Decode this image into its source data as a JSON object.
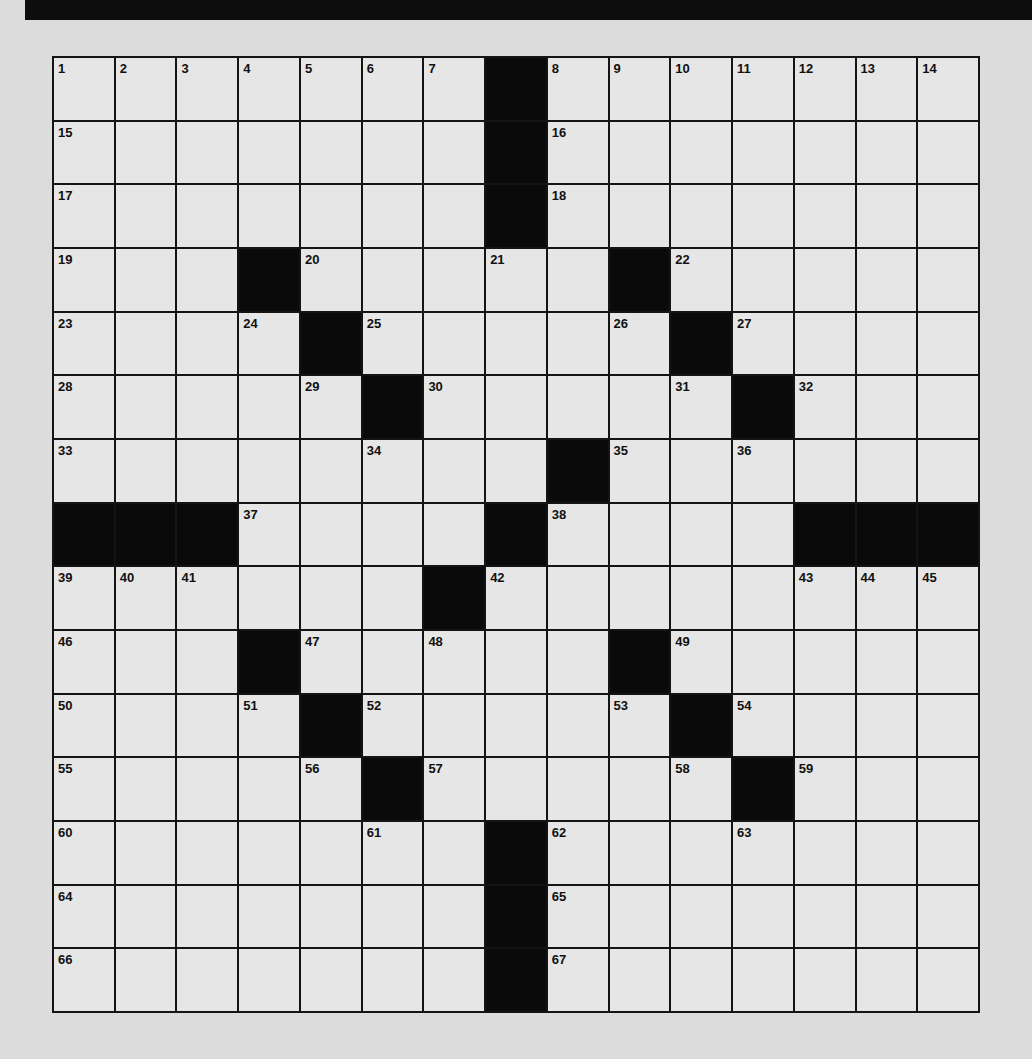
{
  "puzzle": {
    "rows": 15,
    "cols": 15,
    "colors": {
      "background": "#dcdcdc",
      "cell": "#e6e6e6",
      "block": "#0a0a0a",
      "line": "#141414"
    },
    "blacks": [
      [
        0,
        7
      ],
      [
        1,
        7
      ],
      [
        2,
        7
      ],
      [
        3,
        3
      ],
      [
        3,
        9
      ],
      [
        4,
        4
      ],
      [
        4,
        10
      ],
      [
        5,
        5
      ],
      [
        5,
        11
      ],
      [
        6,
        8
      ],
      [
        7,
        0
      ],
      [
        7,
        1
      ],
      [
        7,
        2
      ],
      [
        7,
        7
      ],
      [
        7,
        12
      ],
      [
        7,
        13
      ],
      [
        7,
        14
      ],
      [
        8,
        6
      ],
      [
        9,
        3
      ],
      [
        9,
        9
      ],
      [
        10,
        4
      ],
      [
        10,
        10
      ],
      [
        11,
        5
      ],
      [
        11,
        11
      ],
      [
        12,
        7
      ],
      [
        13,
        7
      ],
      [
        14,
        7
      ]
    ],
    "numbers": [
      {
        "r": 0,
        "c": 0,
        "n": "1"
      },
      {
        "r": 0,
        "c": 1,
        "n": "2"
      },
      {
        "r": 0,
        "c": 2,
        "n": "3"
      },
      {
        "r": 0,
        "c": 3,
        "n": "4"
      },
      {
        "r": 0,
        "c": 4,
        "n": "5"
      },
      {
        "r": 0,
        "c": 5,
        "n": "6"
      },
      {
        "r": 0,
        "c": 6,
        "n": "7"
      },
      {
        "r": 0,
        "c": 8,
        "n": "8"
      },
      {
        "r": 0,
        "c": 9,
        "n": "9"
      },
      {
        "r": 0,
        "c": 10,
        "n": "10"
      },
      {
        "r": 0,
        "c": 11,
        "n": "11"
      },
      {
        "r": 0,
        "c": 12,
        "n": "12"
      },
      {
        "r": 0,
        "c": 13,
        "n": "13"
      },
      {
        "r": 0,
        "c": 14,
        "n": "14"
      },
      {
        "r": 1,
        "c": 0,
        "n": "15"
      },
      {
        "r": 1,
        "c": 8,
        "n": "16"
      },
      {
        "r": 2,
        "c": 0,
        "n": "17"
      },
      {
        "r": 2,
        "c": 8,
        "n": "18"
      },
      {
        "r": 3,
        "c": 0,
        "n": "19"
      },
      {
        "r": 3,
        "c": 4,
        "n": "20"
      },
      {
        "r": 3,
        "c": 7,
        "n": "21"
      },
      {
        "r": 3,
        "c": 10,
        "n": "22"
      },
      {
        "r": 4,
        "c": 0,
        "n": "23"
      },
      {
        "r": 4,
        "c": 3,
        "n": "24"
      },
      {
        "r": 4,
        "c": 5,
        "n": "25"
      },
      {
        "r": 4,
        "c": 9,
        "n": "26"
      },
      {
        "r": 4,
        "c": 11,
        "n": "27"
      },
      {
        "r": 5,
        "c": 0,
        "n": "28"
      },
      {
        "r": 5,
        "c": 4,
        "n": "29"
      },
      {
        "r": 5,
        "c": 6,
        "n": "30"
      },
      {
        "r": 5,
        "c": 10,
        "n": "31"
      },
      {
        "r": 5,
        "c": 12,
        "n": "32"
      },
      {
        "r": 6,
        "c": 0,
        "n": "33"
      },
      {
        "r": 6,
        "c": 5,
        "n": "34"
      },
      {
        "r": 6,
        "c": 9,
        "n": "35"
      },
      {
        "r": 6,
        "c": 11,
        "n": "36"
      },
      {
        "r": 7,
        "c": 3,
        "n": "37"
      },
      {
        "r": 7,
        "c": 8,
        "n": "38"
      },
      {
        "r": 8,
        "c": 0,
        "n": "39"
      },
      {
        "r": 8,
        "c": 1,
        "n": "40"
      },
      {
        "r": 8,
        "c": 2,
        "n": "41"
      },
      {
        "r": 8,
        "c": 7,
        "n": "42"
      },
      {
        "r": 8,
        "c": 12,
        "n": "43"
      },
      {
        "r": 8,
        "c": 13,
        "n": "44"
      },
      {
        "r": 8,
        "c": 14,
        "n": "45"
      },
      {
        "r": 9,
        "c": 0,
        "n": "46"
      },
      {
        "r": 9,
        "c": 4,
        "n": "47"
      },
      {
        "r": 9,
        "c": 6,
        "n": "48"
      },
      {
        "r": 9,
        "c": 10,
        "n": "49"
      },
      {
        "r": 10,
        "c": 0,
        "n": "50"
      },
      {
        "r": 10,
        "c": 3,
        "n": "51"
      },
      {
        "r": 10,
        "c": 5,
        "n": "52"
      },
      {
        "r": 10,
        "c": 9,
        "n": "53"
      },
      {
        "r": 10,
        "c": 11,
        "n": "54"
      },
      {
        "r": 11,
        "c": 0,
        "n": "55"
      },
      {
        "r": 11,
        "c": 4,
        "n": "56"
      },
      {
        "r": 11,
        "c": 6,
        "n": "57"
      },
      {
        "r": 11,
        "c": 10,
        "n": "58"
      },
      {
        "r": 11,
        "c": 12,
        "n": "59"
      },
      {
        "r": 12,
        "c": 0,
        "n": "60"
      },
      {
        "r": 12,
        "c": 5,
        "n": "61"
      },
      {
        "r": 12,
        "c": 8,
        "n": "62"
      },
      {
        "r": 12,
        "c": 11,
        "n": "63"
      },
      {
        "r": 13,
        "c": 0,
        "n": "64"
      },
      {
        "r": 13,
        "c": 8,
        "n": "65"
      },
      {
        "r": 14,
        "c": 0,
        "n": "66"
      },
      {
        "r": 14,
        "c": 8,
        "n": "67"
      }
    ],
    "letters": []
  }
}
